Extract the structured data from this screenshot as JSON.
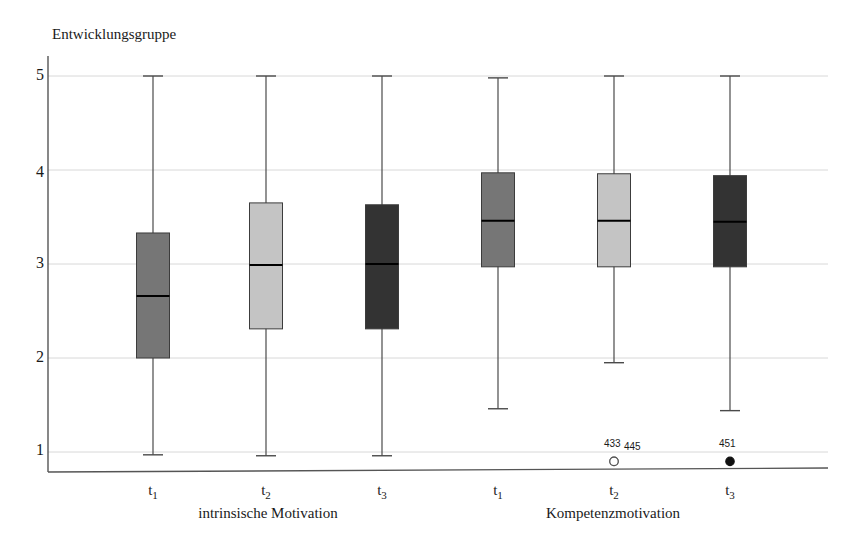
{
  "chart_data": {
    "type": "box",
    "title": "Entwicklungsgruppe",
    "xlabel": "",
    "ylabel": "Entwicklungsgruppe",
    "ylim": [
      0.8,
      5.0
    ],
    "yticks": [
      1,
      2,
      3,
      4,
      5
    ],
    "ytick_labels": [
      "1",
      "2",
      "3",
      "4",
      "5"
    ],
    "grid": true,
    "legend": "none",
    "groups": [
      {
        "name": "intrinsische Motivation",
        "boxes": [
          {
            "tick": "t",
            "tick_sub": "1",
            "fill": "#767676",
            "whisker_low": 0.97,
            "q1": 2.0,
            "median": 2.66,
            "q3": 3.33,
            "whisker_high": 5.0,
            "outliers": []
          },
          {
            "tick": "t",
            "tick_sub": "2",
            "fill": "#c4c4c4",
            "whisker_low": 0.96,
            "q1": 2.31,
            "median": 2.99,
            "q3": 3.65,
            "whisker_high": 5.0,
            "outliers": []
          },
          {
            "tick": "t",
            "tick_sub": "3",
            "fill": "#333333",
            "whisker_low": 0.96,
            "q1": 2.31,
            "median": 3.0,
            "q3": 3.63,
            "whisker_high": 5.0,
            "outliers": []
          }
        ]
      },
      {
        "name": "Kompetenzmotivation",
        "boxes": [
          {
            "tick": "t",
            "tick_sub": "1",
            "fill": "#767676",
            "whisker_low": 1.46,
            "q1": 2.97,
            "median": 3.46,
            "q3": 3.97,
            "whisker_high": 4.98,
            "outliers": []
          },
          {
            "tick": "t",
            "tick_sub": "2",
            "fill": "#c4c4c4",
            "whisker_low": 1.95,
            "q1": 2.97,
            "median": 3.46,
            "q3": 3.96,
            "whisker_high": 5.0,
            "outliers": [
              {
                "label": "433",
                "value": 0.9,
                "style": "open"
              },
              {
                "label": "445",
                "value": 0.9,
                "style": "open"
              }
            ]
          },
          {
            "tick": "t",
            "tick_sub": "3",
            "fill": "#333333",
            "whisker_low": 1.44,
            "q1": 2.97,
            "median": 3.45,
            "q3": 3.94,
            "whisker_high": 5.0,
            "outliers": [
              {
                "label": "451",
                "value": 0.9,
                "style": "filled"
              }
            ]
          }
        ]
      }
    ]
  },
  "axis": {
    "title": "Entwicklungsgruppe",
    "ytick_1": "1",
    "ytick_2": "2",
    "ytick_3": "3",
    "ytick_4": "4",
    "ytick_5": "5"
  },
  "xlabels": {
    "g1_t1": "t",
    "g1_t1_sub": "1",
    "g1_t2": "t",
    "g1_t2_sub": "2",
    "g1_t3": "t",
    "g1_t3_sub": "3",
    "g2_t1": "t",
    "g2_t1_sub": "1",
    "g2_t2": "t",
    "g2_t2_sub": "2",
    "g2_t3": "t",
    "g2_t3_sub": "3",
    "group1": "intrinsische Motivation",
    "group2": "Kompetenzmotivation"
  },
  "outliers": {
    "o433": "433",
    "o445": "445",
    "o451": "451"
  },
  "colors": {
    "box_medium": "#767676",
    "box_light": "#c4c4c4",
    "box_dark": "#333333",
    "grid": "#d8d8d8",
    "axis": "#555555",
    "text": "#1a1a1a"
  }
}
